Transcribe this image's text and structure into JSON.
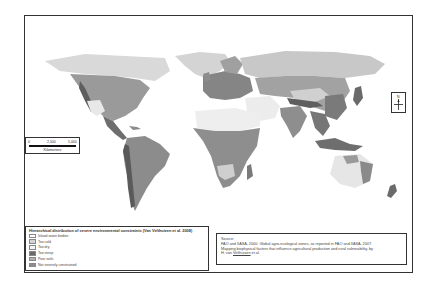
{
  "map": {
    "title": "Hierarchical distribution of severe environmental constraints (Van Velthuizen et al. 2008)",
    "colors": {
      "frame": "#333333",
      "ocean": "#ffffff",
      "too_cold": "#d4d4d4",
      "too_dry": "#ebebeb",
      "too_steep": "#6a6a6a",
      "poor_soils": "#a8a8a8",
      "not_constrained": "#8c8c8c",
      "inland_water": "#ffffff"
    }
  },
  "scalebar": {
    "ticks": [
      "0",
      "2,500",
      "5,000"
    ],
    "unit": "Kilometers"
  },
  "north_arrow": {
    "label": "N"
  },
  "legend": {
    "title": "Hierarchical distribution of severe environmental constraints (Van Velthuizen et al. 2008)",
    "items": [
      {
        "label": "Inland water bodies",
        "color": "#ffffff"
      },
      {
        "label": "Too cold",
        "color": "#d4d4d4"
      },
      {
        "label": "Too dry",
        "color": "#f4f4f4"
      },
      {
        "label": "Too steep",
        "color": "#6a6a6a"
      },
      {
        "label": "Poor soils",
        "color": "#b0b0b0"
      },
      {
        "label": "Not severely constrained",
        "color": "#8c8c8c"
      }
    ]
  },
  "source": {
    "heading": "Source:",
    "line1": "FAO and IIASA, 2000. Global agro-ecological zones, as reported in FAO and IIASA, 2007.",
    "line2": "Mapping biophysical factors that influence agricultural production and rural vulnerability, by",
    "line3_prefix": "H. van ",
    "line3_author": "Velthuizen",
    "line3_suffix": " et al."
  }
}
